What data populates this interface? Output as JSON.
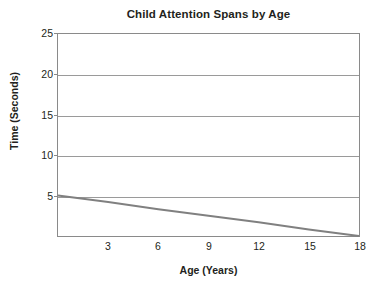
{
  "chart_data": {
    "type": "line",
    "title": "Child Attention Spans by Age",
    "xlabel": "Age (Years)",
    "ylabel": "Time (Seconds)",
    "xlim": [
      0,
      18
    ],
    "ylim": [
      0,
      25
    ],
    "grid": true,
    "legend": false,
    "xticks": [
      3,
      6,
      9,
      12,
      15,
      18
    ],
    "yticks": [
      5,
      10,
      15,
      20,
      25
    ],
    "series": [
      {
        "name": "Attention span",
        "color": "#808080",
        "x": [
          0,
          3,
          6,
          9,
          12,
          15,
          18
        ],
        "values": [
          5.0,
          4.2,
          3.3,
          2.5,
          1.7,
          0.8,
          0.0
        ]
      }
    ]
  },
  "axes": {
    "y_tick_labels": [
      "25",
      "20",
      "15",
      "10",
      "5"
    ],
    "x_tick_labels": [
      "3",
      "6",
      "9",
      "12",
      "15",
      "18"
    ]
  },
  "colors": {
    "series_line": "#808080",
    "gridline": "#9a9a9a",
    "frame": "#8a8a8a",
    "text": "#231f20",
    "background": "#ffffff"
  }
}
